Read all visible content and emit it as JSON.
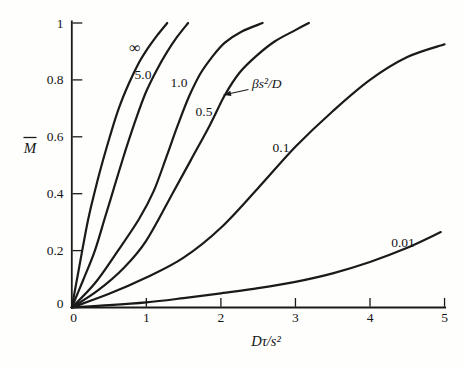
{
  "figure": {
    "background": "#fefefd",
    "ink": "#1a1a1a"
  },
  "chart_data": {
    "type": "line",
    "title": "",
    "xlabel": "Dτ/s²",
    "ylabel": "M̄",
    "ylabel_base": "M",
    "ylabel_has_overbar": true,
    "xlim": [
      0,
      5
    ],
    "ylim": [
      0,
      1
    ],
    "grid": false,
    "legend_position": "inline-curve-labels",
    "x_ticks": [
      0,
      1,
      2,
      3,
      4,
      5
    ],
    "x_tick_labels": [
      "0",
      "1",
      "2",
      "3",
      "4",
      "5"
    ],
    "y_ticks": [
      0,
      0.2,
      0.4,
      0.6,
      0.8,
      1
    ],
    "y_tick_labels": [
      "0",
      "0.2",
      "0.4",
      "0.6",
      "0.8",
      "1"
    ],
    "parameter_label": "βs²/D",
    "series": [
      {
        "name": "∞",
        "label_px": [
          135,
          48
        ],
        "label_font_px": 16,
        "points": [
          [
            0,
            0
          ],
          [
            0.07,
            0.1
          ],
          [
            0.14,
            0.2
          ],
          [
            0.22,
            0.31
          ],
          [
            0.3,
            0.4
          ],
          [
            0.4,
            0.5
          ],
          [
            0.51,
            0.6
          ],
          [
            0.63,
            0.7
          ],
          [
            0.77,
            0.79
          ],
          [
            0.9,
            0.86
          ],
          [
            1.03,
            0.915
          ],
          [
            1.15,
            0.958
          ],
          [
            1.28,
            1.0
          ]
        ]
      },
      {
        "name": "5.0",
        "label_px": [
          143,
          74.5
        ],
        "label_font_px": 13.5,
        "points": [
          [
            0,
            0
          ],
          [
            0.15,
            0.095
          ],
          [
            0.31,
            0.2
          ],
          [
            0.45,
            0.32
          ],
          [
            0.6,
            0.45
          ],
          [
            0.73,
            0.56
          ],
          [
            0.87,
            0.67
          ],
          [
            1.0,
            0.76
          ],
          [
            1.13,
            0.83
          ],
          [
            1.27,
            0.895
          ],
          [
            1.41,
            0.95
          ],
          [
            1.56,
            1.0
          ]
        ]
      },
      {
        "name": "1.0",
        "label_px": [
          179,
          82.5
        ],
        "label_font_px": 13.5,
        "points": [
          [
            0,
            0
          ],
          [
            0.31,
            0.085
          ],
          [
            0.62,
            0.2
          ],
          [
            0.9,
            0.31
          ],
          [
            1.1,
            0.41
          ],
          [
            1.27,
            0.53
          ],
          [
            1.42,
            0.64
          ],
          [
            1.57,
            0.74
          ],
          [
            1.72,
            0.82
          ],
          [
            1.88,
            0.88
          ],
          [
            2.05,
            0.93
          ],
          [
            2.28,
            0.97
          ],
          [
            2.56,
            1.0
          ]
        ]
      },
      {
        "name": "0.5",
        "label_px": [
          204,
          111.5
        ],
        "label_font_px": 13.5,
        "points": [
          [
            0,
            0
          ],
          [
            0.35,
            0.06
          ],
          [
            0.7,
            0.14
          ],
          [
            1.0,
            0.235
          ],
          [
            1.35,
            0.4
          ],
          [
            1.6,
            0.52
          ],
          [
            1.85,
            0.64
          ],
          [
            2.05,
            0.745
          ],
          [
            2.25,
            0.825
          ],
          [
            2.48,
            0.885
          ],
          [
            2.72,
            0.935
          ],
          [
            3.0,
            0.975
          ],
          [
            3.18,
            1.0
          ]
        ]
      },
      {
        "name": "0.1",
        "label_px": [
          281,
          147.5
        ],
        "label_font_px": 13.5,
        "points": [
          [
            0,
            0
          ],
          [
            0.5,
            0.048
          ],
          [
            1.0,
            0.105
          ],
          [
            1.5,
            0.175
          ],
          [
            2.0,
            0.28
          ],
          [
            2.5,
            0.42
          ],
          [
            3.0,
            0.565
          ],
          [
            3.5,
            0.69
          ],
          [
            4.0,
            0.8
          ],
          [
            4.5,
            0.88
          ],
          [
            5.0,
            0.925
          ]
        ]
      },
      {
        "name": "0.01",
        "label_px": [
          403,
          242
        ],
        "label_font_px": 13.5,
        "points": [
          [
            0,
            0
          ],
          [
            0.5,
            0.008
          ],
          [
            1.0,
            0.018
          ],
          [
            1.5,
            0.033
          ],
          [
            2.0,
            0.05
          ],
          [
            2.5,
            0.068
          ],
          [
            3.0,
            0.09
          ],
          [
            3.5,
            0.12
          ],
          [
            4.0,
            0.16
          ],
          [
            4.5,
            0.21
          ],
          [
            4.95,
            0.265
          ]
        ]
      }
    ],
    "annotation": {
      "text": "βs²/D",
      "text_px": [
        252,
        87.5
      ],
      "arrow_from_px": [
        248.5,
        89.5
      ],
      "arrow_to_px": [
        223.5,
        95
      ],
      "points_to_series": "0.5"
    }
  }
}
